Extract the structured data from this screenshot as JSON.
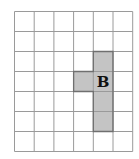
{
  "diagram": {
    "type": "grid",
    "columns": 6,
    "rows": 7,
    "cell_width": 19.7,
    "cell_height": 20,
    "grid_line_color": "#9a9a9a",
    "shape": {
      "label": "B",
      "fill_color": "#c4c4c4",
      "border_color": "#6f6f6f",
      "cells": [
        [
          4,
          2
        ],
        [
          4,
          3
        ],
        [
          3,
          3
        ],
        [
          4,
          4
        ],
        [
          4,
          5
        ]
      ]
    }
  }
}
